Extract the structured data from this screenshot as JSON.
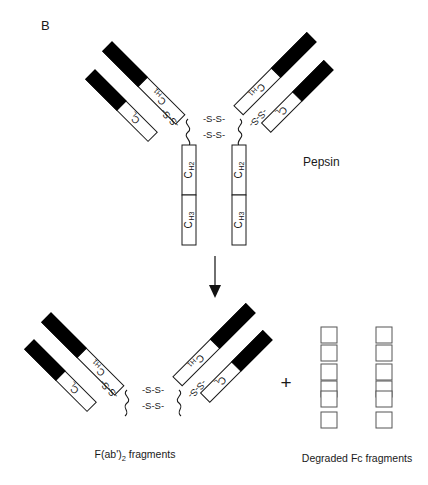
{
  "figure": {
    "panel_label": "B",
    "enzyme": "Pepsin",
    "background_color": "#ffffff",
    "ink_color": "#1a1a1a",
    "variable_region_color": "#000000"
  },
  "labels": {
    "c_l": "C",
    "c_l_sub": "L",
    "c_h1": "C",
    "c_h1_sub": "H1",
    "c_h2": "C",
    "c_h2_sub": "H2",
    "c_h3": "C",
    "c_h3_sub": "H3",
    "disulfide": "-S-S-",
    "interchain_disulfide": "-S-S-"
  },
  "captions": {
    "fab2": "F(ab')",
    "fab2_sub": "2",
    "fab2_rest": " fragments",
    "fc": "Degraded Fc fragments",
    "plus": "+"
  },
  "intact_antibody": {
    "name": "intact-immunoglobulin",
    "arms": [
      {
        "side": "left",
        "light_chain_label": "C_L",
        "heavy_chain_label": "C_H1",
        "interchain_bond": "-S-S-"
      },
      {
        "side": "right",
        "light_chain_label": "C_L",
        "heavy_chain_label": "C_H1",
        "interchain_bond": "-S-S-"
      }
    ],
    "fc_region": {
      "domains": [
        "C_H2",
        "C_H3"
      ],
      "chains": 2
    },
    "hinge_bonds": [
      "-S-S-",
      "-S-S-"
    ]
  },
  "products": {
    "fab2_fragment": {
      "arms": 2,
      "domains": [
        "C_L",
        "C_H1"
      ],
      "hinge_bonds": [
        "-S-S-",
        "-S-S-"
      ],
      "interchain_bonds": [
        "-S-S-",
        "-S-S-"
      ]
    },
    "fc_fragments": {
      "columns": 2,
      "pieces_per_column": 6,
      "total_pieces": 12
    }
  },
  "reaction": {
    "arrow_direction": "down",
    "arrow_icon": "downward-arrow"
  }
}
